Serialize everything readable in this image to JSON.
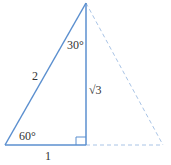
{
  "diagram": {
    "colors": {
      "line": "#5b8fcf",
      "dashed": "#a9c4e6",
      "text": "#333333"
    },
    "labels": {
      "hypotenuse": "2",
      "base": "1",
      "height": "√3",
      "top_angle": "30°",
      "bottom_angle": "60°"
    }
  }
}
